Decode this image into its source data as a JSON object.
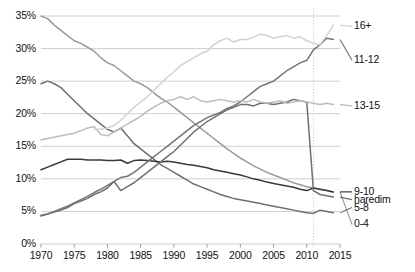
{
  "chart_data": {
    "type": "line",
    "title": "",
    "xlabel": "",
    "ylabel": "",
    "xlim": [
      1970,
      2015
    ],
    "ylim": [
      0,
      35
    ],
    "grid": true,
    "legend_position": "right-inline",
    "y_ticks": [
      "0%",
      "5%",
      "10%",
      "15%",
      "20%",
      "25%",
      "30%",
      "35%"
    ],
    "y_tick_values": [
      0,
      5,
      10,
      15,
      20,
      25,
      30,
      35
    ],
    "x_ticks": [
      "1970",
      "1975",
      "1980",
      "1985",
      "1990",
      "1995",
      "2000",
      "2005",
      "2010",
      "2015"
    ],
    "x_tick_values": [
      1970,
      1975,
      1980,
      1985,
      1990,
      1995,
      2000,
      2005,
      2010,
      2015
    ],
    "annotation_vline": 2011,
    "series": [
      {
        "name": "0-4",
        "label": "0-4",
        "color": "#9a9a9a",
        "label_y": 3.0,
        "x": [
          1970,
          1971,
          1972,
          1973,
          1974,
          1975,
          1976,
          1977,
          1978,
          1979,
          1980,
          1981,
          1982,
          1983,
          1984,
          1985,
          1986,
          1987,
          1988,
          1989,
          1990,
          1991,
          1992,
          1993,
          1994,
          1995,
          1996,
          1997,
          1998,
          1999,
          2000,
          2001,
          2002,
          2003,
          2004,
          2005,
          2006,
          2007,
          2008,
          2009,
          2010,
          2011,
          2012,
          2013,
          2014
        ],
        "y": [
          35.0,
          34.6,
          33.6,
          32.8,
          32.0,
          31.2,
          30.8,
          30.2,
          29.6,
          28.6,
          27.8,
          27.4,
          26.6,
          25.8,
          25.0,
          24.6,
          24.0,
          23.2,
          22.4,
          21.8,
          21.0,
          20.2,
          19.4,
          18.6,
          17.8,
          17.0,
          16.2,
          15.4,
          14.6,
          13.9,
          13.2,
          12.6,
          12.0,
          11.5,
          11.0,
          10.6,
          10.2,
          9.8,
          9.4,
          9.1,
          8.8,
          8.6,
          8.4,
          8.2,
          8.0
        ]
      },
      {
        "name": "5-8",
        "label": "5-8",
        "color": "#6f6f6f",
        "label_y": 5.6,
        "x": [
          1970,
          1971,
          1972,
          1973,
          1974,
          1975,
          1976,
          1977,
          1978,
          1979,
          1980,
          1981,
          1982,
          1983,
          1984,
          1985,
          1986,
          1987,
          1988,
          1989,
          1990,
          1991,
          1992,
          1993,
          1994,
          1995,
          1996,
          1997,
          1998,
          1999,
          2000,
          2001,
          2002,
          2003,
          2004,
          2005,
          2006,
          2007,
          2008,
          2009,
          2010,
          2011,
          2012,
          2013,
          2014
        ],
        "y": [
          24.6,
          25.0,
          24.6,
          24.0,
          23.0,
          22.0,
          21.0,
          20.0,
          19.2,
          18.4,
          17.6,
          17.2,
          17.8,
          16.6,
          15.4,
          14.6,
          13.8,
          13.0,
          12.2,
          11.6,
          11.0,
          10.4,
          9.8,
          9.2,
          8.8,
          8.4,
          8.0,
          7.6,
          7.3,
          7.0,
          6.8,
          6.6,
          6.4,
          6.2,
          6.0,
          5.8,
          5.6,
          5.4,
          5.2,
          5.0,
          4.8,
          4.7,
          5.2,
          5.0,
          4.8
        ]
      },
      {
        "name": "9-10",
        "label": "9-10",
        "color": "#3a3a3a",
        "label_y": 8.0,
        "x": [
          1970,
          1971,
          1972,
          1973,
          1974,
          1975,
          1976,
          1977,
          1978,
          1979,
          1980,
          1981,
          1982,
          1983,
          1984,
          1985,
          1986,
          1987,
          1988,
          1989,
          1990,
          1991,
          1992,
          1993,
          1994,
          1995,
          1996,
          1997,
          1998,
          1999,
          2000,
          2001,
          2002,
          2003,
          2004,
          2005,
          2006,
          2007,
          2008,
          2009,
          2010,
          2011,
          2012,
          2013,
          2014
        ],
        "y": [
          11.4,
          11.8,
          12.2,
          12.6,
          13.0,
          13.0,
          13.0,
          12.9,
          12.9,
          12.9,
          12.8,
          12.8,
          12.9,
          12.4,
          12.8,
          12.9,
          12.8,
          12.7,
          12.6,
          12.7,
          12.6,
          12.4,
          12.2,
          12.1,
          11.9,
          11.7,
          11.4,
          11.2,
          11.0,
          10.8,
          10.6,
          10.3,
          10.0,
          9.8,
          9.5,
          9.3,
          9.1,
          8.9,
          8.7,
          8.4,
          8.2,
          8.6,
          8.4,
          8.2,
          8.0
        ]
      },
      {
        "name": "haredim",
        "label": "haredim",
        "color": "#6f6f6f",
        "label_y": 6.8,
        "x": [
          1970,
          1971,
          1972,
          1973,
          1974,
          1975,
          1976,
          1977,
          1978,
          1979,
          1980,
          1981,
          1982,
          1983,
          1984,
          1985,
          1986,
          1987,
          1988,
          1989,
          1990,
          1991,
          1992,
          1993,
          1994,
          1995,
          1996,
          1997,
          1998,
          1999,
          2000,
          2001,
          2002,
          2003,
          2004,
          2005,
          2006,
          2007,
          2008,
          2009,
          2010,
          2011,
          2012,
          2013,
          2014
        ],
        "y": [
          4.4,
          4.6,
          4.9,
          5.2,
          5.6,
          6.2,
          6.6,
          7.0,
          7.6,
          8.0,
          8.6,
          9.6,
          8.2,
          8.8,
          9.4,
          10.2,
          11.0,
          11.8,
          12.6,
          13.4,
          14.2,
          15.2,
          16.2,
          17.2,
          18.0,
          18.8,
          19.4,
          20.0,
          20.6,
          21.0,
          21.4,
          21.4,
          21.2,
          21.6,
          21.6,
          21.4,
          21.6,
          21.8,
          22.2,
          22.0,
          21.8,
          8.2,
          7.6,
          7.4,
          7.2
        ]
      },
      {
        "name": "11-12",
        "label": "11-12",
        "color": "#757575",
        "label_y": 28.2,
        "x": [
          1970,
          1971,
          1972,
          1973,
          1974,
          1975,
          1976,
          1977,
          1978,
          1979,
          1980,
          1981,
          1982,
          1983,
          1984,
          1985,
          1986,
          1987,
          1988,
          1989,
          1990,
          1991,
          1992,
          1993,
          1994,
          1995,
          1996,
          1997,
          1998,
          1999,
          2000,
          2001,
          2002,
          2003,
          2004,
          2005,
          2006,
          2007,
          2008,
          2009,
          2010,
          2011,
          2012,
          2013,
          2014
        ],
        "y": [
          4.3,
          4.6,
          5.0,
          5.4,
          5.8,
          6.3,
          6.8,
          7.3,
          7.9,
          8.4,
          9.0,
          9.6,
          10.2,
          10.4,
          11.0,
          11.8,
          12.6,
          13.4,
          14.2,
          15.0,
          15.8,
          16.6,
          17.4,
          18.2,
          18.8,
          19.4,
          19.8,
          20.2,
          20.8,
          21.2,
          21.8,
          22.6,
          23.4,
          24.2,
          24.6,
          25.0,
          25.8,
          26.6,
          27.2,
          27.8,
          28.2,
          29.8,
          30.6,
          31.6,
          31.4
        ]
      },
      {
        "name": "13-15",
        "label": "13-15",
        "color": "#bdbdbd",
        "label_y": 21.2,
        "x": [
          1970,
          1971,
          1972,
          1973,
          1974,
          1975,
          1976,
          1977,
          1978,
          1979,
          1980,
          1981,
          1982,
          1983,
          1984,
          1985,
          1986,
          1987,
          1988,
          1989,
          1990,
          1991,
          1992,
          1993,
          1994,
          1995,
          1996,
          1997,
          1998,
          1999,
          2000,
          2001,
          2002,
          2003,
          2004,
          2005,
          2006,
          2007,
          2008,
          2009,
          2010,
          2011,
          2012,
          2013,
          2014
        ],
        "y": [
          16.0,
          16.2,
          16.4,
          16.6,
          16.8,
          17.0,
          17.4,
          17.8,
          18.0,
          16.8,
          16.6,
          17.2,
          17.8,
          18.4,
          19.0,
          19.6,
          20.4,
          21.0,
          21.6,
          22.0,
          22.2,
          22.6,
          22.2,
          22.6,
          22.0,
          21.8,
          22.0,
          22.2,
          22.0,
          21.8,
          22.0,
          21.8,
          22.2,
          21.8,
          21.6,
          21.8,
          22.0,
          21.6,
          21.8,
          22.0,
          21.8,
          21.6,
          21.4,
          21.6,
          21.4
        ]
      },
      {
        "name": "16+",
        "label": "16+",
        "color": "#d2d2d2",
        "label_y": 33.4,
        "x": [
          1978,
          1979,
          1980,
          1981,
          1982,
          1983,
          1984,
          1985,
          1986,
          1987,
          1988,
          1989,
          1990,
          1991,
          1992,
          1993,
          1994,
          1995,
          1996,
          1997,
          1998,
          1999,
          2000,
          2001,
          2002,
          2003,
          2004,
          2005,
          2006,
          2007,
          2008,
          2009,
          2010,
          2011,
          2012,
          2013,
          2014
        ],
        "y": [
          17.6,
          17.6,
          17.8,
          18.2,
          19.0,
          20.0,
          21.0,
          21.8,
          22.6,
          23.6,
          24.6,
          25.6,
          26.4,
          27.4,
          28.0,
          28.6,
          29.2,
          29.6,
          30.6,
          31.2,
          31.6,
          31.0,
          31.4,
          31.4,
          31.8,
          32.2,
          32.0,
          31.6,
          31.8,
          32.0,
          31.6,
          31.8,
          31.2,
          30.8,
          30.6,
          32.0,
          33.6
        ]
      }
    ]
  }
}
